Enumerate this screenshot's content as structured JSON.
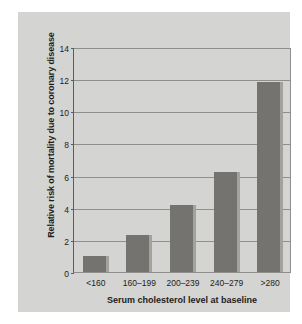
{
  "chart_data": {
    "type": "bar",
    "title": "",
    "subtitle": "",
    "xlabel": "Serum cholesterol level at baseline",
    "ylabel": "Relative risk of mortality due to coronary disease",
    "categories": [
      "<160",
      "160–199",
      "200–239",
      "240–279",
      ">280"
    ],
    "values": [
      1.0,
      2.3,
      4.2,
      6.2,
      11.8
    ],
    "series": [
      {
        "name": "Relative risk of mortality due to coronary disease",
        "values": [
          1.0,
          2.3,
          4.2,
          6.2,
          11.8
        ]
      }
    ],
    "ylim": [
      0,
      14
    ],
    "yticks": [
      0,
      2,
      4,
      6,
      8,
      10,
      12,
      14
    ],
    "ytick_labels": [
      "0",
      "2",
      "4",
      "6",
      "8",
      "10",
      "12",
      "14"
    ],
    "xlim_categorical": true,
    "grid": "horizontal",
    "legend": "none",
    "annotations": []
  },
  "style": {
    "panel_background": "#d4d4d2",
    "page_background": "#ffffff",
    "bar_color": "#74736f",
    "bar_highlight_color": "#a3a29d",
    "gridline_color": "#8e8e8c",
    "axis_color": "#5d5d5b",
    "text_color": "#1c1c1c"
  }
}
